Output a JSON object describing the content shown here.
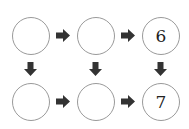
{
  "diagram": {
    "nodes": [
      {
        "id": "r1c1",
        "value": ""
      },
      {
        "id": "r1c2",
        "value": ""
      },
      {
        "id": "r1c3",
        "value": "6"
      },
      {
        "id": "r2c1",
        "value": ""
      },
      {
        "id": "r2c2",
        "value": ""
      },
      {
        "id": "r2c3",
        "value": "7"
      }
    ],
    "edges": [
      {
        "from": "r1c1",
        "to": "r1c2",
        "direction": "right"
      },
      {
        "from": "r1c2",
        "to": "r1c3",
        "direction": "right"
      },
      {
        "from": "r2c1",
        "to": "r2c2",
        "direction": "right"
      },
      {
        "from": "r2c2",
        "to": "r2c3",
        "direction": "right"
      },
      {
        "from": "r1c1",
        "to": "r2c1",
        "direction": "down"
      },
      {
        "from": "r1c2",
        "to": "r2c2",
        "direction": "down"
      },
      {
        "from": "r1c3",
        "to": "r2c3",
        "direction": "down"
      }
    ],
    "colors": {
      "circle_border": "#9a9a9a",
      "arrow": "#333333",
      "text": "#222222"
    }
  }
}
